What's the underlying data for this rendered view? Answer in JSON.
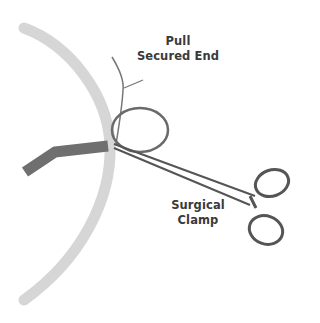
{
  "diagram": {
    "labels": {
      "pull_secured_end": {
        "line1": "Pull",
        "line2": "Secured End"
      },
      "surgical_clamp": {
        "line1": "Surgical",
        "line2": "Clamp"
      }
    },
    "components": [
      "curved-tube",
      "dark-tube",
      "suture-thread",
      "surgical-clamp"
    ],
    "colors": {
      "curved_tube": "#d6d6d6",
      "dark_tube": "#6f6f6f",
      "clamp_outline": "#555555",
      "label_text": "#3a3a3a",
      "background": "#ffffff"
    }
  }
}
